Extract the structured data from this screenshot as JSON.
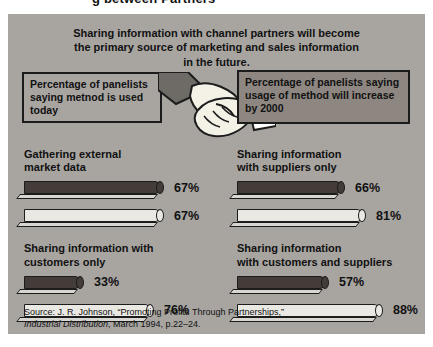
{
  "page": {
    "partial_title": "g between Partners",
    "header_line1": "Sharing information with channel partners will become",
    "header_line2": "the primary source of marketing and sales information",
    "header_line3": "in the future.",
    "legend_left": "Percentage of panelists saying metnod is used today",
    "legend_right": "Percentage of panelists saying usage of method will increase by 2000",
    "source_line1": "Source: J. R. Johnson, “Promoting Profits Through Partnerships,”",
    "source_italic": "Industrial Distribution",
    "source_line2_rest": ", March 1994, p.22–24."
  },
  "groups": [
    {
      "label1": "Gathering external",
      "label2": "market data",
      "dark_pct": "67%",
      "light_pct": "67%",
      "dark_px": 136,
      "light_px": 136
    },
    {
      "label1": "Sharing information",
      "label2": "with suppliers only",
      "dark_pct": "66%",
      "light_pct": "81%",
      "dark_px": 104,
      "light_px": 125
    },
    {
      "label1": "Sharing information with",
      "label2": "customers only",
      "dark_pct": "33%",
      "light_pct": "76%",
      "dark_px": 56,
      "light_px": 126
    },
    {
      "label1": "Sharing information",
      "label2": "with customers and suppliers",
      "dark_pct": "57%",
      "light_pct": "88%",
      "dark_px": 88,
      "light_px": 146
    }
  ],
  "chart_data": {
    "type": "bar",
    "orientation": "horizontal",
    "title": "Sharing information with channel partners will become the primary source of marketing and sales information in the future.",
    "categories": [
      "Gathering external market data",
      "Sharing information with suppliers only",
      "Sharing information with customers only",
      "Sharing information with customers and suppliers"
    ],
    "series": [
      {
        "name": "Percentage of panelists saying metnod is used today",
        "values": [
          67,
          66,
          33,
          57
        ]
      },
      {
        "name": "Percentage of panelists saying usage of method will increase by 2000",
        "values": [
          67,
          81,
          76,
          88
        ]
      }
    ],
    "unit": "%",
    "xlim": [
      0,
      100
    ],
    "grid": false,
    "legend_position": "top",
    "source": "Source: J. R. Johnson, “Promoting Profits Through Partnerships,” Industrial Distribution, March 1994, p.22–24."
  },
  "colors": {
    "panel_bg": "#a8a5a1",
    "box_right_bg": "#8e8781",
    "dark_bar": "#433c38",
    "light_bar": "#eae8e3",
    "bar_base": "#d8d6d1",
    "outline": "#1c1c1c",
    "text": "#111111",
    "hand_fill": "#f4f1e6",
    "sleeve_dark": "#6e6a66",
    "sleeve_light": "#ffffff"
  }
}
